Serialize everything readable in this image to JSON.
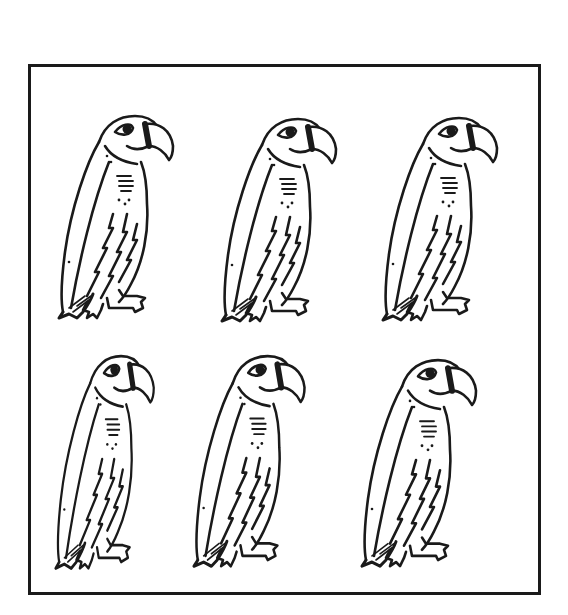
{
  "figure": {
    "rows": 2,
    "columns": 3,
    "count": 6,
    "subject": "parrot",
    "stroke_color": "#1a1a1a",
    "background_color": "#ffffff",
    "parrots": [
      {
        "label": "parrot 1",
        "row": 1,
        "col": 1
      },
      {
        "label": "parrot 2",
        "row": 1,
        "col": 2
      },
      {
        "label": "parrot 3",
        "row": 1,
        "col": 3
      },
      {
        "label": "parrot 4",
        "row": 2,
        "col": 1
      },
      {
        "label": "parrot 5",
        "row": 2,
        "col": 2
      },
      {
        "label": "parrot 6",
        "row": 2,
        "col": 3
      }
    ]
  }
}
